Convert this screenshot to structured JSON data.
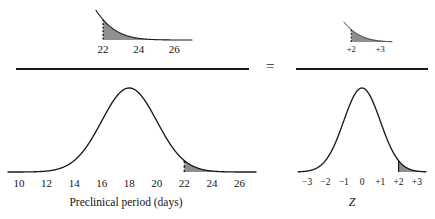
{
  "figure": {
    "type": "statistical-diagram",
    "operator": "=",
    "curve_color": "#1a1a1a",
    "shade_color": "#8f8f8f",
    "background": "#ffffff"
  },
  "left": {
    "inset": {
      "name": "magnified-tail-days",
      "ticks": [
        "22",
        "24",
        "26"
      ],
      "tick_values": [
        22,
        24,
        26
      ],
      "boundary_value": 22,
      "boundary_style": "dotted"
    },
    "main": {
      "name": "preclinical-period-distribution",
      "axis_title": "Preclinical period (days)",
      "ticks": [
        "10",
        "12",
        "14",
        "16",
        "18",
        "20",
        "22",
        "24",
        "26"
      ],
      "tick_values": [
        10,
        12,
        14,
        16,
        18,
        20,
        22,
        24,
        26
      ],
      "mean": 18,
      "sd": 2,
      "shade_from": 22,
      "shade_to": 27,
      "boundary_style": "dashed"
    }
  },
  "right": {
    "inset": {
      "name": "magnified-tail-z",
      "ticks": [
        "+2",
        "+3"
      ],
      "tick_values": [
        2,
        3
      ],
      "boundary_value": 2,
      "boundary_style": "dotted"
    },
    "main": {
      "name": "standard-normal-distribution",
      "axis_title": "Z",
      "ticks": [
        "−3",
        "−2",
        "−1",
        "0",
        "+1",
        "+2",
        "+3"
      ],
      "tick_values": [
        -3,
        -2,
        -1,
        0,
        1,
        2,
        3
      ],
      "mean": 0,
      "sd": 1,
      "shade_from": 2,
      "shade_to": 3.4,
      "boundary_style": "solid"
    }
  },
  "chart_data": {
    "type": "line",
    "title": "",
    "panels": [
      {
        "id": "left-inset",
        "kind": "magnified-tail",
        "xlabel": "",
        "xlim": [
          21.6,
          27.0
        ],
        "ticks": [
          22,
          24,
          26
        ],
        "tick_labels": [
          "22",
          "24",
          "26"
        ],
        "distribution": "normal",
        "mean": 18,
        "sd": 2,
        "shaded_region": [
          22,
          27.0
        ],
        "boundary_line": 22
      },
      {
        "id": "left-main",
        "kind": "normal-curve",
        "xlabel": "Preclinical period (days)",
        "ylabel": "",
        "xlim": [
          9.2,
          27.2
        ],
        "ticks": [
          10,
          12,
          14,
          16,
          18,
          20,
          22,
          24,
          26
        ],
        "tick_labels": [
          "10",
          "12",
          "14",
          "16",
          "18",
          "20",
          "22",
          "24",
          "26"
        ],
        "distribution": "normal",
        "mean": 18,
        "sd": 2,
        "shaded_region": [
          22,
          27.2
        ],
        "boundary_line": 22
      },
      {
        "id": "right-inset",
        "kind": "magnified-tail",
        "xlabel": "",
        "xlim": [
          1.75,
          3.4
        ],
        "ticks": [
          2,
          3
        ],
        "tick_labels": [
          "+2",
          "+3"
        ],
        "distribution": "normal",
        "mean": 0,
        "sd": 1,
        "shaded_region": [
          2,
          3.4
        ],
        "boundary_line": 2
      },
      {
        "id": "right-main",
        "kind": "normal-curve",
        "xlabel": "Z",
        "ylabel": "",
        "xlim": [
          -3.5,
          3.5
        ],
        "ticks": [
          -3,
          -2,
          -1,
          0,
          1,
          2,
          3
        ],
        "tick_labels": [
          "−3",
          "−2",
          "−1",
          "0",
          "+1",
          "+2",
          "+3"
        ],
        "distribution": "normal",
        "mean": 0,
        "sd": 1,
        "shaded_region": [
          2,
          3.5
        ],
        "boundary_line": 2
      }
    ]
  }
}
